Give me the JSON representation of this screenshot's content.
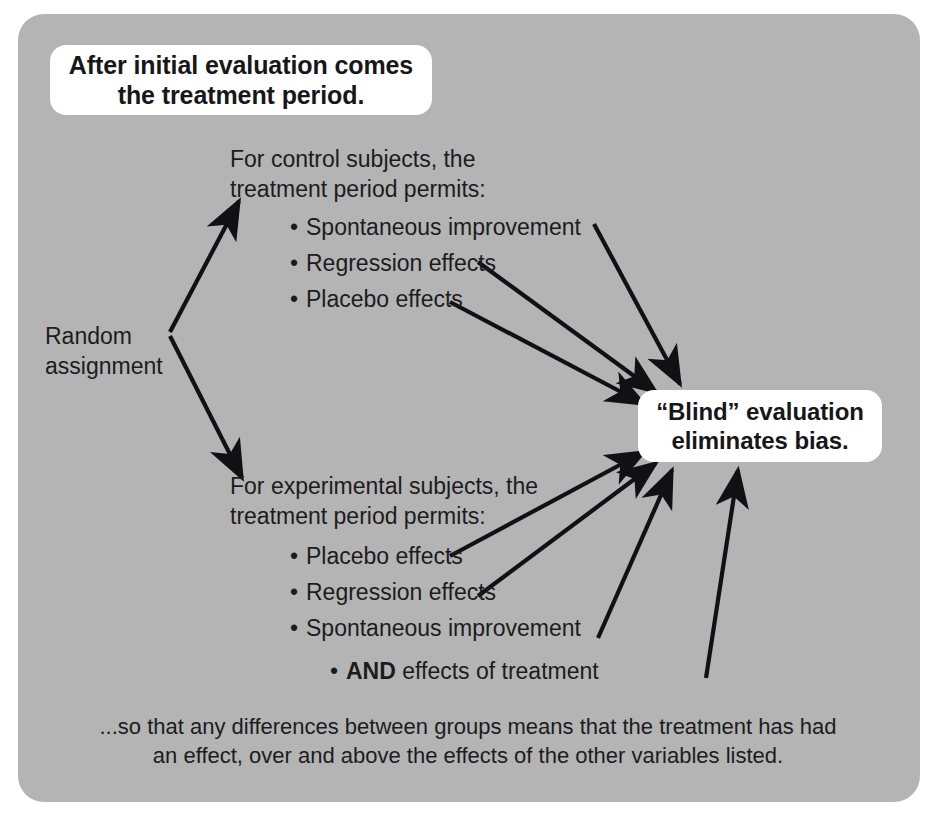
{
  "panel": {
    "background_color": "#b4b4b4",
    "corner_radius_px": 26
  },
  "callouts": {
    "top": {
      "text": "After initial evaluation comes\nthe treatment period.",
      "background_color": "#ffffff",
      "text_color": "#17171a"
    },
    "blind": {
      "text": "“Blind” evaluation\neliminates bias.",
      "background_color": "#ffffff",
      "text_color": "#17171a"
    }
  },
  "labels": {
    "random_assignment": "Random\nassignment",
    "control_heading": "For control subjects, the\ntreatment period permits:",
    "experimental_heading": "For experimental subjects, the\ntreatment period permits:"
  },
  "control_bullets": [
    "Spontaneous improvement",
    "Regression effects",
    "Placebo effects"
  ],
  "experimental_bullets": [
    "Placebo effects",
    "Regression effects",
    "Spontaneous improvement"
  ],
  "and_line": {
    "bullet": "•",
    "emphasis": "AND",
    "rest": " effects of treatment"
  },
  "footer_note": "...so that any differences between groups means that the treatment has had\nan effect, over and above the effects of the other variables listed.",
  "bullet_glyph": "•",
  "arrow_color": "#111114"
}
